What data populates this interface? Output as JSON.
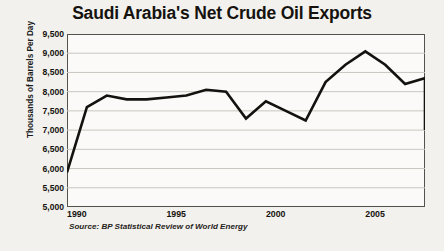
{
  "chart_data": {
    "type": "line",
    "title": "Saudi Arabia's Net Crude Oil Exports",
    "xlabel": "",
    "ylabel": "Thousands of Barrels Per Day",
    "source": "Source: BP Statistical Review of World Energy",
    "grid": true,
    "legend": "none",
    "xlim": [
      1990,
      2008
    ],
    "ylim": [
      5000,
      9500
    ],
    "ytick_step": 500,
    "yticks": [
      "5,000",
      "5,500",
      "6,000",
      "6,500",
      "7,000",
      "7,500",
      "8,000",
      "8,500",
      "9,000",
      "9,500"
    ],
    "ytick_values": [
      5000,
      5500,
      6000,
      6500,
      7000,
      7500,
      8000,
      8500,
      9000,
      9500
    ],
    "xticks": [
      "1990",
      "1995",
      "2000",
      "2005"
    ],
    "xtick_values": [
      1990,
      1995,
      2000,
      2005
    ],
    "x": [
      1990,
      1991,
      1992,
      1993,
      1994,
      1995,
      1996,
      1997,
      1998,
      1999,
      2000,
      2001,
      2002,
      2003,
      2004,
      2005,
      2006,
      2007,
      2008
    ],
    "values": [
      5900,
      7600,
      7900,
      7800,
      7800,
      7850,
      7900,
      8050,
      8000,
      7300,
      7750,
      7500,
      7250,
      8250,
      8700,
      9050,
      8700,
      8200,
      8350
    ],
    "series": [
      {
        "name": "Net Crude Oil Exports",
        "color": "#14110e",
        "values": [
          5900,
          7600,
          7900,
          7800,
          7800,
          7850,
          7900,
          8050,
          8000,
          7300,
          7750,
          7500,
          7250,
          8250,
          8700,
          9050,
          8700,
          8200,
          8350
        ]
      }
    ],
    "final_value": 7000,
    "line_color": "#14110e",
    "line_width": 2.6,
    "background": "#f2f1ee",
    "plot_background": "#fbfaf8",
    "axis_color": "#55524e",
    "grid_color": "#c9c6c1"
  }
}
